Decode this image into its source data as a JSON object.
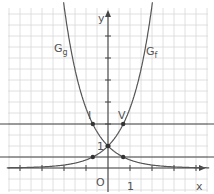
{
  "chart_data": {
    "type": "line",
    "title": "",
    "xlabel": "x",
    "ylabel": "y",
    "xlim": [
      -4.6,
      4.6
    ],
    "ylim": [
      -1.1,
      7.5
    ],
    "grid": true,
    "grid_minor_step": 0.5,
    "origin_label": "O",
    "tick_labels": {
      "x_one": "1",
      "y_one": "1"
    },
    "series": [
      {
        "name": "G_f",
        "label_main": "G",
        "label_sub": "f",
        "formula": "e^x"
      },
      {
        "name": "G_g",
        "label_main": "G",
        "label_sub": "g",
        "formula": "e^-x"
      }
    ],
    "horizontal_lines": [
      2,
      0.5
    ],
    "points": [
      {
        "label": "I",
        "x": -0.69,
        "y": 2
      },
      {
        "label": "V",
        "x": 0.69,
        "y": 2
      },
      {
        "label": "1",
        "x": 0,
        "y": 1
      },
      {
        "label": "",
        "x": -0.69,
        "y": 0.5
      },
      {
        "label": "",
        "x": 0.69,
        "y": 0.5
      }
    ],
    "colors": {
      "axis": "#444444",
      "curve": "#555555",
      "grid": "#d8d8d8",
      "text": "#555555"
    }
  }
}
